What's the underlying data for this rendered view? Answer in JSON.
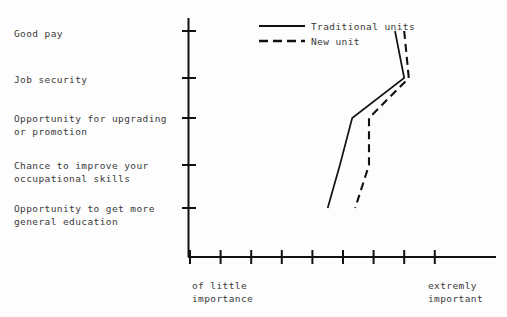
{
  "chart_data": {
    "type": "line",
    "title": "",
    "orientation": "horizontal-categories",
    "xlabel_left": "of little\nimportance",
    "xlabel_right": "extremly\nimportant",
    "categories": [
      "Good pay",
      "Job security",
      "Opportunity for upgrading\nor promotion",
      "Chance to improve your\noccupational skills",
      "Opportunity to get more\ngeneral education"
    ],
    "xlim": [
      0,
      9
    ],
    "x_tick_count": 9,
    "y_tick_count": 5,
    "grid": false,
    "legend_position": "top-center",
    "series": [
      {
        "name": "Traditional units",
        "style": "solid",
        "values": [
          7.7,
          8.0,
          6.3,
          5.9,
          5.5
        ]
      },
      {
        "name": "New unit",
        "style": "dashed",
        "values": [
          8.0,
          8.15,
          6.85,
          6.85,
          6.4
        ]
      }
    ]
  },
  "legend": {
    "items": [
      {
        "label": "Traditional units",
        "style": "solid"
      },
      {
        "label": "New unit",
        "style": "dashed"
      }
    ]
  },
  "axes": {
    "left_labels": [
      "Good pay",
      "Job security",
      "Opportunity for upgrading",
      "or promotion",
      "Chance to improve your",
      "occupational skills",
      "Opportunity to get more",
      "general education"
    ],
    "bottom_left_caption_line1": "of little",
    "bottom_left_caption_line2": "importance",
    "bottom_right_caption_line1": "extremly",
    "bottom_right_caption_line2": "important"
  },
  "colors": {
    "ink": "#111111",
    "text": "#3a3a3a",
    "background": "#fdfdfd"
  }
}
